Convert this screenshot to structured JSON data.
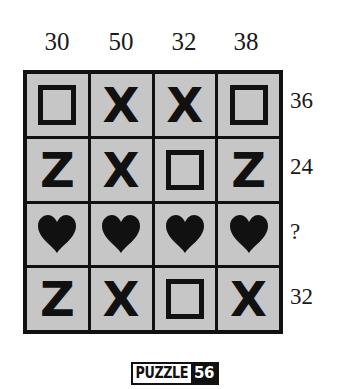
{
  "puzzle": {
    "column_totals": [
      "30",
      "50",
      "32",
      "38"
    ],
    "row_totals": [
      "36",
      "24",
      "?",
      "32"
    ],
    "grid": [
      [
        "square",
        "X",
        "X",
        "square"
      ],
      [
        "Z",
        "X",
        "square",
        "Z"
      ],
      [
        "heart",
        "heart",
        "heart",
        "heart"
      ],
      [
        "Z",
        "X",
        "square",
        "X"
      ]
    ],
    "badge": {
      "word": "PUZZLE",
      "number": "56"
    }
  },
  "colors": {
    "cell_bg": "#c6c6c6",
    "ink": "#111111",
    "background": "#ffffff"
  }
}
